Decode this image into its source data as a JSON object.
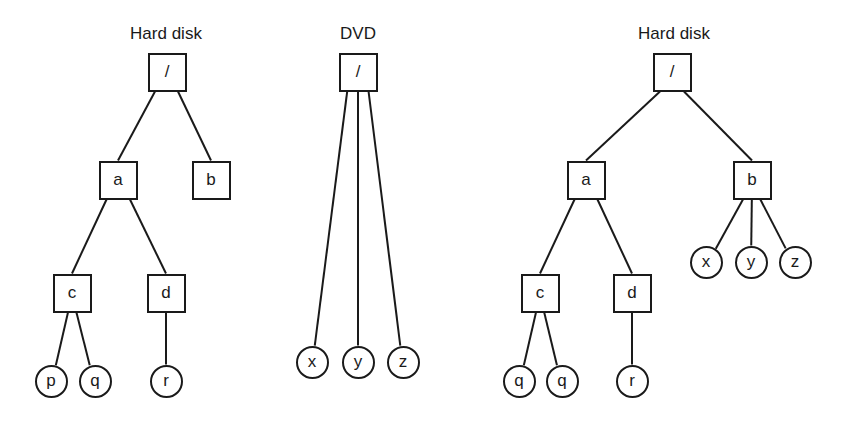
{
  "trees": [
    {
      "title": "Hard disk",
      "title_pos": [
        166,
        34
      ],
      "nodes": [
        {
          "id": "root",
          "label": "/",
          "type": "dir",
          "x": 167,
          "y": 72
        },
        {
          "id": "a",
          "label": "a",
          "type": "dir",
          "x": 118,
          "y": 180
        },
        {
          "id": "b",
          "label": "b",
          "type": "dir",
          "x": 211,
          "y": 180
        },
        {
          "id": "c",
          "label": "c",
          "type": "dir",
          "x": 72,
          "y": 293
        },
        {
          "id": "d",
          "label": "d",
          "type": "dir",
          "x": 166,
          "y": 293
        },
        {
          "id": "p",
          "label": "p",
          "type": "file",
          "x": 51,
          "y": 381
        },
        {
          "id": "q",
          "label": "q",
          "type": "file",
          "x": 95,
          "y": 381
        },
        {
          "id": "r",
          "label": "r",
          "type": "file",
          "x": 166,
          "y": 381
        }
      ],
      "edges": [
        [
          "root",
          "a"
        ],
        [
          "root",
          "b"
        ],
        [
          "a",
          "c"
        ],
        [
          "a",
          "d"
        ],
        [
          "c",
          "p"
        ],
        [
          "c",
          "q"
        ],
        [
          "d",
          "r"
        ]
      ]
    },
    {
      "title": "DVD",
      "title_pos": [
        358,
        34
      ],
      "nodes": [
        {
          "id": "root",
          "label": "/",
          "type": "dir",
          "x": 358,
          "y": 72
        },
        {
          "id": "x",
          "label": "x",
          "type": "file",
          "x": 312,
          "y": 362
        },
        {
          "id": "y",
          "label": "y",
          "type": "file",
          "x": 358,
          "y": 362
        },
        {
          "id": "z",
          "label": "z",
          "type": "file",
          "x": 403,
          "y": 362
        }
      ],
      "edges": [
        [
          "root",
          "x"
        ],
        [
          "root",
          "y"
        ],
        [
          "root",
          "z"
        ]
      ]
    },
    {
      "title": "Hard disk",
      "title_pos": [
        674,
        34
      ],
      "nodes": [
        {
          "id": "root",
          "label": "/",
          "type": "dir",
          "x": 672,
          "y": 72
        },
        {
          "id": "a",
          "label": "a",
          "type": "dir",
          "x": 586,
          "y": 180
        },
        {
          "id": "b",
          "label": "b",
          "type": "dir",
          "x": 752,
          "y": 180
        },
        {
          "id": "x",
          "label": "x",
          "type": "file",
          "x": 706,
          "y": 262
        },
        {
          "id": "y",
          "label": "y",
          "type": "file",
          "x": 751,
          "y": 262
        },
        {
          "id": "z",
          "label": "z",
          "type": "file",
          "x": 795,
          "y": 262
        },
        {
          "id": "c",
          "label": "c",
          "type": "dir",
          "x": 540,
          "y": 293
        },
        {
          "id": "d",
          "label": "d",
          "type": "dir",
          "x": 632,
          "y": 293
        },
        {
          "id": "q1",
          "label": "q",
          "type": "file",
          "x": 519,
          "y": 381
        },
        {
          "id": "q2",
          "label": "q",
          "type": "file",
          "x": 562,
          "y": 381
        },
        {
          "id": "r",
          "label": "r",
          "type": "file",
          "x": 632,
          "y": 381
        }
      ],
      "edges": [
        [
          "root",
          "a"
        ],
        [
          "root",
          "b"
        ],
        [
          "b",
          "x"
        ],
        [
          "b",
          "y"
        ],
        [
          "b",
          "z"
        ],
        [
          "a",
          "c"
        ],
        [
          "a",
          "d"
        ],
        [
          "c",
          "q1"
        ],
        [
          "c",
          "q2"
        ],
        [
          "d",
          "r"
        ]
      ]
    }
  ],
  "colors": {
    "stroke": "#1a1a1a",
    "background": "#ffffff"
  }
}
